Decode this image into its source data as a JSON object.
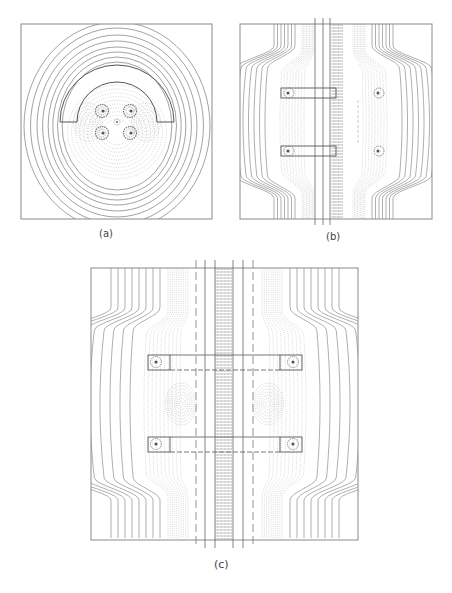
{
  "figure": {
    "panels": [
      {
        "id": "a",
        "label": "(a)",
        "description": "Semicircular electrode with four ion rings and central node; concentric field contours"
      },
      {
        "id": "b",
        "label": "(b)",
        "description": "Two rectangular electrodes with vertical rail lines and bulging contours"
      },
      {
        "id": "c",
        "label": "(c)",
        "description": "Four rectangular electrodes connected by horizontal bars across a central vertical rail array"
      }
    ],
    "colors": {
      "frame": "#8a8a8a",
      "contour_solid": "#7a7a7a",
      "contour_dotted": "#b5b5b5",
      "electrode": "#444444",
      "hotspot": "#555555"
    }
  }
}
